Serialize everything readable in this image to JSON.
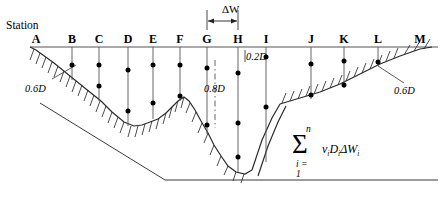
{
  "figure": {
    "caption": "Station",
    "width": 442,
    "height": 215,
    "line_color": "#4a4a4a",
    "ink_color": "#000000"
  },
  "stations": [
    {
      "label": "A",
      "x": 36,
      "dots": []
    },
    {
      "label": "B",
      "x": 72,
      "dots": [
        65
      ]
    },
    {
      "label": "C",
      "x": 99,
      "dots": [
        65,
        86
      ]
    },
    {
      "label": "D",
      "x": 128,
      "dots": [
        70,
        111
      ]
    },
    {
      "label": "E",
      "x": 153,
      "dots": [
        65,
        103
      ]
    },
    {
      "label": "F",
      "x": 180,
      "dots": [
        65,
        96
      ]
    },
    {
      "label": "G",
      "x": 207,
      "dots": [
        68,
        125
      ]
    },
    {
      "label": "H",
      "x": 238,
      "dots": [
        73,
        123,
        157
      ]
    },
    {
      "label": "I",
      "x": 266,
      "dots": [
        57,
        107
      ]
    },
    {
      "label": "J",
      "x": 311,
      "dots": [
        64,
        95
      ]
    },
    {
      "label": "K",
      "x": 344,
      "dots": [
        61,
        85
      ]
    },
    {
      "label": "L",
      "x": 378,
      "dots": [
        62
      ]
    },
    {
      "label": "M",
      "x": 420,
      "dots": []
    }
  ],
  "annotations": {
    "delta_w": "ΔW",
    "left_bank_depth": "0.6D",
    "right_bank_depth": "0.6D",
    "shallow_depth": "0.2D",
    "deep_depth": "0.8D"
  },
  "formula": {
    "sigma": "Σ",
    "upper_limit": "n",
    "lower_limit": "i = 1",
    "term_v": "v",
    "term_v_sub": "i",
    "term_d": "D",
    "term_d_sub": "i",
    "term_dw": "ΔW",
    "term_dw_sub": "i"
  }
}
